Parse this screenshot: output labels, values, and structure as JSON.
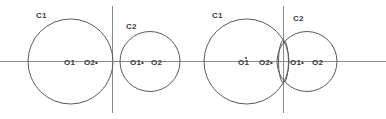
{
  "figure": {
    "width": 386,
    "height": 119,
    "background_color": "#ffffff",
    "stroke_color": "#5a5a5a",
    "axis_color": "#8a8a8a",
    "text_color": "#3a3a3a"
  },
  "panels": [
    {
      "id": "panel-1",
      "description": "Single large circle C1 tangent internally at the vertical axis",
      "circles": [
        {
          "name": "C1",
          "cx": 70.5,
          "cy": 61.5,
          "r": 42.5,
          "label": "C1",
          "label_x": 36,
          "label_y": 15
        }
      ],
      "axes": {
        "horizontal": {
          "x1": 0,
          "y1": 61.5,
          "x2": 120,
          "y2": 61.5
        },
        "vertical": {
          "x1": 112.5,
          "y1": 6,
          "x2": 112.5,
          "y2": 113
        }
      },
      "points": [
        {
          "label": "O1",
          "x": 64,
          "y": 64,
          "dot": false
        },
        {
          "label": "O2•",
          "x": 84,
          "y": 64,
          "dot": false
        }
      ]
    },
    {
      "id": "panel-2",
      "description": "Single smaller circle C2 tangent to the vertical axis",
      "circles": [
        {
          "name": "C2",
          "cx": 150,
          "cy": 61.5,
          "r": 30,
          "label": "C2",
          "label_x": 126,
          "label_y": 26
        }
      ],
      "axes": {
        "horizontal": {
          "x1": 112,
          "y1": 61.5,
          "x2": 196,
          "y2": 61.5
        },
        "vertical": {
          "x1": 112.5,
          "y1": 6,
          "x2": 112.5,
          "y2": 113
        }
      },
      "points": [
        {
          "label": "O1•",
          "x": 130,
          "y": 64,
          "dot": false
        },
        {
          "label": "O2",
          "x": 150,
          "y": 64,
          "dot": false
        }
      ]
    },
    {
      "id": "panel-3",
      "description": "Two overlapping circles C1 and C2 crossing at a narrow lens on the vertical axis",
      "circles": [
        {
          "name": "C1",
          "cx": 246.5,
          "cy": 61.5,
          "r": 42.5,
          "label": "C1",
          "label_x": 212,
          "label_y": 15
        },
        {
          "name": "C2",
          "cx": 307,
          "cy": 61.5,
          "r": 30,
          "label": "C2",
          "label_x": 293,
          "label_y": 18
        }
      ],
      "lens": {
        "cx": 283.5,
        "cy": 61.5,
        "rx": 5,
        "ry": 21
      },
      "axes": {
        "horizontal": {
          "x1": 196,
          "y1": 61.5,
          "x2": 386,
          "y2": 61.5
        },
        "vertical": {
          "x1": 283.5,
          "y1": 6,
          "x2": 283.5,
          "y2": 113
        }
      },
      "points": [
        {
          "label": "O1",
          "x": 238,
          "y": 64,
          "dot": true,
          "dot_x": 245,
          "dot_y": 57
        },
        {
          "label": "O2•",
          "x": 259,
          "y": 64,
          "dot": false
        },
        {
          "label": "O1•",
          "x": 290,
          "y": 64,
          "dot": false
        },
        {
          "label": "O2",
          "x": 311,
          "y": 64,
          "dot": false
        }
      ]
    }
  ],
  "labels": {
    "c1": "C1",
    "c2": "C2",
    "o1": "O1",
    "o2": "O2",
    "o1_dot": "O1•",
    "o2_dot": "O2•"
  }
}
